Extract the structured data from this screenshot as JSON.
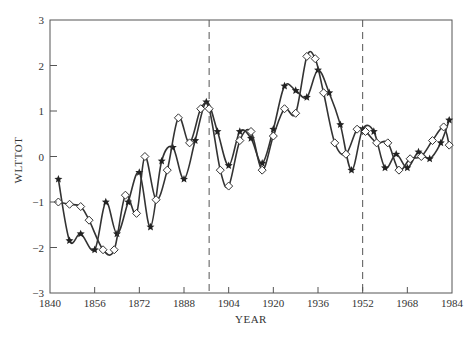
{
  "chart_data": {
    "type": "line",
    "title": "",
    "xlabel": "YEAR",
    "ylabel": "WLTTOT",
    "xlim": [
      1840,
      1984
    ],
    "ylim": [
      -3,
      3
    ],
    "x_ticks": [
      1840,
      1856,
      1872,
      1888,
      1904,
      1920,
      1936,
      1952,
      1968,
      1984
    ],
    "y_ticks": [
      -3,
      -2,
      -1,
      0,
      1,
      2,
      3
    ],
    "grid": false,
    "legend": null,
    "vertical_dashed_lines": [
      1897,
      1952
    ],
    "series": [
      {
        "name": "star-series",
        "marker": "star",
        "x": [
          1843,
          1847,
          1851,
          1856,
          1860,
          1864,
          1868,
          1872,
          1876,
          1880,
          1884,
          1888,
          1892,
          1896,
          1900,
          1904,
          1908,
          1912,
          1916,
          1920,
          1924,
          1928,
          1932,
          1936,
          1940,
          1944,
          1948,
          1952,
          1956,
          1960,
          1964,
          1968,
          1972,
          1976,
          1980,
          1983
        ],
        "y": [
          -0.5,
          -1.85,
          -1.7,
          -2.05,
          -1.0,
          -1.7,
          -1.0,
          -0.35,
          -1.55,
          -0.1,
          0.2,
          -0.5,
          0.35,
          1.2,
          0.55,
          -0.2,
          0.55,
          0.4,
          -0.15,
          0.6,
          1.55,
          1.45,
          1.3,
          1.9,
          1.4,
          0.7,
          -0.3,
          0.6,
          0.55,
          -0.25,
          0.05,
          -0.25,
          0.1,
          -0.05,
          0.3,
          0.8
        ]
      },
      {
        "name": "diamond-series",
        "marker": "diamond",
        "x": [
          1843,
          1847,
          1851,
          1854,
          1859,
          1863,
          1867,
          1871,
          1874,
          1878,
          1882,
          1886,
          1890,
          1894,
          1897,
          1901,
          1904,
          1908,
          1912,
          1916,
          1920,
          1924,
          1928,
          1932,
          1935,
          1938,
          1942,
          1946,
          1950,
          1953,
          1957,
          1961,
          1965,
          1969,
          1973,
          1977,
          1981,
          1983
        ],
        "y": [
          -1.0,
          -1.05,
          -1.1,
          -1.4,
          -2.05,
          -2.05,
          -0.85,
          -1.25,
          0.0,
          -0.95,
          -0.3,
          0.85,
          0.3,
          1.05,
          1.05,
          -0.3,
          -0.65,
          0.35,
          0.55,
          -0.3,
          0.45,
          1.05,
          0.95,
          2.2,
          2.15,
          1.4,
          0.3,
          0.05,
          0.6,
          0.55,
          0.3,
          0.3,
          -0.3,
          -0.05,
          0.0,
          0.35,
          0.65,
          0.25
        ]
      }
    ]
  },
  "axes": {
    "xlabel": "YEAR",
    "ylabel": "WLTTOT"
  }
}
